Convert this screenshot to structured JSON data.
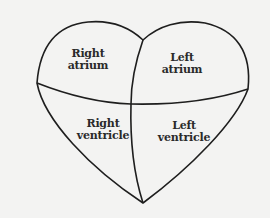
{
  "diagram": {
    "type": "heart-chambers",
    "colors": {
      "background": "#f3f3f2",
      "stroke": "#1e1e1e",
      "text": "#2a2a2a"
    },
    "chambers": [
      {
        "id": "right-atrium",
        "line1": "Right",
        "line2": "atrium"
      },
      {
        "id": "left-atrium",
        "line1": "Left",
        "line2": "atrium"
      },
      {
        "id": "right-ventricle",
        "line1": "Right",
        "line2": "ventricle"
      },
      {
        "id": "left-ventricle",
        "line1": "Left",
        "line2": "ventricle"
      }
    ]
  }
}
